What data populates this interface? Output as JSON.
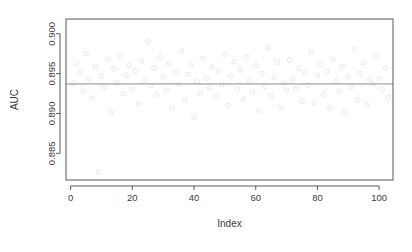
{
  "chart_data": {
    "type": "scatter",
    "title": "",
    "xlabel": "Index",
    "ylabel": "AUC",
    "xlim": [
      -1.5,
      104.5
    ],
    "ylim": [
      0.88165,
      0.90185
    ],
    "xticks": [
      0,
      20,
      40,
      60,
      80,
      100
    ],
    "xticklabels": [
      "0",
      "20",
      "40",
      "60",
      "80",
      "100"
    ],
    "yticks": [
      0.885,
      0.89,
      0.895,
      0.9
    ],
    "yticklabels": [
      "0.885",
      "0.890",
      "0.895",
      "0.900"
    ],
    "grid": false,
    "legend": null,
    "marker": "open-circle",
    "marker_color": "#e8e8ea",
    "reference_line": {
      "orientation": "horizontal",
      "y": 0.8937,
      "color": "#8c8c8c",
      "label": ""
    },
    "x": [
      1,
      2,
      3,
      4,
      5,
      6,
      7,
      8,
      9,
      10,
      11,
      12,
      13,
      14,
      15,
      16,
      17,
      18,
      19,
      20,
      21,
      22,
      23,
      24,
      25,
      26,
      27,
      28,
      29,
      30,
      31,
      32,
      33,
      34,
      35,
      36,
      37,
      38,
      39,
      40,
      41,
      42,
      43,
      44,
      45,
      46,
      47,
      48,
      49,
      50,
      51,
      52,
      53,
      54,
      55,
      56,
      57,
      58,
      59,
      60,
      61,
      62,
      63,
      64,
      65,
      66,
      67,
      68,
      69,
      70,
      71,
      72,
      73,
      74,
      75,
      76,
      77,
      78,
      79,
      80,
      81,
      82,
      83,
      84,
      85,
      86,
      87,
      88,
      89,
      90,
      91,
      92,
      93,
      94,
      95,
      96,
      97,
      98,
      99,
      100,
      101,
      102,
      103
    ],
    "y": [
      0.8938,
      0.8962,
      0.8951,
      0.8928,
      0.8975,
      0.8943,
      0.8919,
      0.8959,
      0.8826,
      0.8947,
      0.8933,
      0.8968,
      0.8901,
      0.8956,
      0.8939,
      0.8972,
      0.8925,
      0.8948,
      0.896,
      0.8931,
      0.8954,
      0.8912,
      0.8966,
      0.8942,
      0.899,
      0.8935,
      0.8957,
      0.8923,
      0.897,
      0.8946,
      0.8929,
      0.8963,
      0.8907,
      0.8952,
      0.8937,
      0.8978,
      0.8916,
      0.8949,
      0.8961,
      0.8895,
      0.894,
      0.8926,
      0.8969,
      0.8944,
      0.8932,
      0.8958,
      0.8921,
      0.8953,
      0.8936,
      0.8974,
      0.891,
      0.8947,
      0.8965,
      0.893,
      0.8955,
      0.8918,
      0.8971,
      0.8941,
      0.8927,
      0.896,
      0.8903,
      0.895,
      0.8934,
      0.8982,
      0.8922,
      0.8945,
      0.8964,
      0.8908,
      0.8938,
      0.8929,
      0.8967,
      0.8943,
      0.8931,
      0.8956,
      0.8915,
      0.8951,
      0.8935,
      0.8976,
      0.8913,
      0.8948,
      0.8962,
      0.8924,
      0.8953,
      0.8906,
      0.8968,
      0.894,
      0.8928,
      0.8959,
      0.8902,
      0.8946,
      0.8933,
      0.898,
      0.8917,
      0.895,
      0.8963,
      0.8911,
      0.8942,
      0.8937,
      0.8971,
      0.8944,
      0.893,
      0.8957,
      0.892
    ]
  }
}
